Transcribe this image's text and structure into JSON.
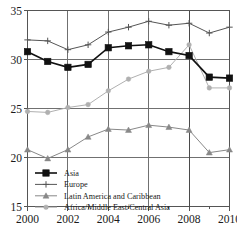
{
  "chart_data": {
    "type": "line",
    "title": "",
    "xlabel": "",
    "ylabel": "",
    "x": [
      2000,
      2001,
      2002,
      2003,
      2004,
      2005,
      2006,
      2007,
      2008,
      2009,
      2010
    ],
    "xlim": [
      2000,
      2010
    ],
    "ylim": [
      15,
      35
    ],
    "grid": true,
    "legend_position": "bottom-left",
    "x_tick_labels": [
      "2000",
      "2002",
      "2004",
      "2006",
      "2008",
      "2010"
    ],
    "x_tick_values": [
      2000,
      2002,
      2004,
      2006,
      2008,
      2010
    ],
    "x_minor_tick_values": [
      2001,
      2003,
      2005,
      2007,
      2009
    ],
    "y_tick_labels": [
      "15",
      "20",
      "25",
      "30",
      "35"
    ],
    "y_tick_values": [
      15,
      20,
      25,
      30,
      35
    ],
    "annotations": [
      {
        "type": "vertical-reference-line",
        "x": 2008,
        "label": ""
      }
    ],
    "series": [
      {
        "name": "Asia",
        "color": "#111111",
        "marker": "filled-square",
        "values": [
          30.8,
          29.8,
          29.2,
          29.5,
          31.2,
          31.4,
          31.5,
          30.8,
          30.4,
          28.2,
          28.1
        ]
      },
      {
        "name": "Europe",
        "color": "#555555",
        "marker": "plus",
        "values": [
          32.0,
          31.9,
          31.0,
          31.5,
          32.8,
          33.3,
          33.9,
          33.5,
          33.7,
          32.7,
          33.3
        ]
      },
      {
        "name": "Latin America and Caribbean",
        "color": "#888888",
        "marker": "triangle",
        "values": [
          20.8,
          19.9,
          20.8,
          22.1,
          22.9,
          22.8,
          23.3,
          23.1,
          22.8,
          20.5,
          20.8
        ]
      },
      {
        "name": "Africa/Middle East/Central Asia",
        "color": "#b0b0b0",
        "marker": "circle",
        "values": [
          24.7,
          24.6,
          25.1,
          25.4,
          26.8,
          28.0,
          28.8,
          29.2,
          31.5,
          27.1,
          27.1
        ]
      }
    ]
  }
}
